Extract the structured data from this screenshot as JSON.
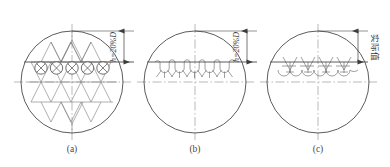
{
  "figure": {
    "title": "",
    "background_color": "#ffffff",
    "width": 390,
    "height": 167,
    "line_color": "#4a4a4a",
    "centerline_color": "#8a8a8a",
    "pattern_color": "#6e6e6e",
    "text_color": "#3d3d3d"
  },
  "panels": [
    {
      "id": "a",
      "caption": "(a)",
      "center_x": 72,
      "center_y": 82,
      "radius": 51,
      "chord_offset_ratio": 0.2,
      "pattern": "diamond-lattice-with-circled-x",
      "circle_count": 5,
      "circle_marker": "x",
      "description": "rhombic lattice with five circled crosses along the chord"
    },
    {
      "id": "b",
      "caption": "(b)",
      "center_x": 195,
      "center_y": 82,
      "radius": 51,
      "chord_offset_ratio": 0.2,
      "pattern": "looped-hook-row",
      "circle_count": 5,
      "circle_marker": "loop",
      "description": "row of small interlocking loops beneath the chord"
    },
    {
      "id": "c",
      "caption": "(c)",
      "center_x": 318,
      "center_y": 82,
      "radius": 51,
      "chord_offset_ratio": 0.2,
      "pattern": "starburst-row",
      "circle_count": 5,
      "circle_marker": "star",
      "description": "row of starburst / asterisk marks beneath the chord"
    }
  ],
  "dimensions": [
    {
      "id": "dim-a",
      "label": "h=20%D",
      "orientation": "vertical",
      "x": 124,
      "y_top": 31,
      "y_bottom": 62,
      "label_x": 118,
      "label_y": 47,
      "arrows": "both"
    },
    {
      "id": "dim-b",
      "label": "h=20%D",
      "orientation": "vertical",
      "x": 247,
      "y_top": 31,
      "y_bottom": 62,
      "label_x": 241,
      "label_y": 47,
      "arrows": "both"
    },
    {
      "id": "dim-c",
      "label": "实际值",
      "orientation": "vertical",
      "x": 358,
      "y_top": 31,
      "y_bottom": 62,
      "label_x": 372,
      "label_y": 47,
      "arrows": "both"
    }
  ],
  "captions": {
    "a": "(a)",
    "b": "(b)",
    "c": "(c)",
    "caption_y": 152
  },
  "dim_labels": {
    "a": "h=20%D",
    "b": "h=20%D",
    "c": "实际值"
  }
}
